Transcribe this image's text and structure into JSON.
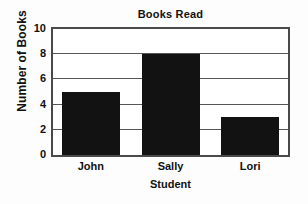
{
  "chart_data": {
    "type": "bar",
    "title": "Books Read",
    "xlabel": "Student",
    "ylabel": "Number of Books",
    "categories": [
      "John",
      "Sally",
      "Lori"
    ],
    "values": [
      5,
      8,
      3
    ],
    "ylim": [
      0,
      10
    ],
    "yticks": [
      0,
      2,
      4,
      6,
      8,
      10
    ],
    "ytick_labels": [
      "0",
      "2",
      "4",
      "6",
      "8",
      "10"
    ],
    "grid": "horizontal",
    "legend": "none",
    "bar_color": "#121212",
    "plot_background": "#ffffff",
    "axis_color": "#4a4a4a",
    "figure_background": "#fdfdfd"
  }
}
